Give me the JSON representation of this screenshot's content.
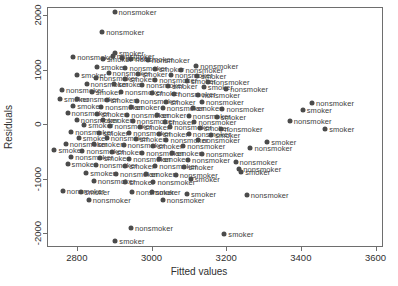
{
  "chart_data": {
    "type": "scatter",
    "title": "",
    "xlabel": "Fitted values",
    "ylabel": "Residuals",
    "xlim": [
      2720,
      3620
    ],
    "ylim": [
      -2250,
      2150
    ],
    "xticks": [
      2800,
      3000,
      3200,
      3400,
      3600
    ],
    "yticks": [
      2000,
      1000,
      0,
      -1000,
      -2000
    ],
    "xtick_labels": [
      "2800",
      "3000",
      "3200",
      "3400",
      "3600"
    ],
    "ytick_labels": [
      "2000",
      "1000",
      "0",
      "-1000",
      "-2000"
    ],
    "grid": false,
    "legend": "none",
    "point_color": "#4b4b4b",
    "label_color": "#414141",
    "axis_color": "#6e6e6e",
    "label_field": "smoker status",
    "categories": [
      "nonsmoker",
      "smoker"
    ],
    "points": [
      {
        "x": 2901,
        "y": 2060,
        "label": "nonsmoker"
      },
      {
        "x": 2868,
        "y": 1690,
        "label": "nonsmoker"
      },
      {
        "x": 2902,
        "y": 1310,
        "label": "smoker"
      },
      {
        "x": 2790,
        "y": 1240,
        "label": "nonsmoker"
      },
      {
        "x": 2896,
        "y": 1255,
        "label": "nonsmoker"
      },
      {
        "x": 2920,
        "y": 1215,
        "label": "smoker"
      },
      {
        "x": 2946,
        "y": 1205,
        "label": "nonsmoker"
      },
      {
        "x": 2870,
        "y": 1190,
        "label": "smoker"
      },
      {
        "x": 2990,
        "y": 1170,
        "label": "nonsmoker"
      },
      {
        "x": 3120,
        "y": 1065,
        "label": "nonsmoker"
      },
      {
        "x": 2854,
        "y": 1050,
        "label": "smoker"
      },
      {
        "x": 2930,
        "y": 1040,
        "label": "nonsmoker"
      },
      {
        "x": 3010,
        "y": 1020,
        "label": "smoker"
      },
      {
        "x": 3080,
        "y": 1000,
        "label": "nonsmoker"
      },
      {
        "x": 2801,
        "y": 905,
        "label": "smoker"
      },
      {
        "x": 2885,
        "y": 935,
        "label": "nonsmoker"
      },
      {
        "x": 2965,
        "y": 930,
        "label": "smoker"
      },
      {
        "x": 3052,
        "y": 905,
        "label": "nonsmoker"
      },
      {
        "x": 3122,
        "y": 880,
        "label": "smoker"
      },
      {
        "x": 2850,
        "y": 845,
        "label": "nonsmoker"
      },
      {
        "x": 2930,
        "y": 830,
        "label": "smoker"
      },
      {
        "x": 3010,
        "y": 810,
        "label": "nonsmoker"
      },
      {
        "x": 3095,
        "y": 790,
        "label": "smoker"
      },
      {
        "x": 3150,
        "y": 780,
        "label": "nonsmoker"
      },
      {
        "x": 2826,
        "y": 745,
        "label": "nonsmoker"
      },
      {
        "x": 2900,
        "y": 730,
        "label": "smoker"
      },
      {
        "x": 2975,
        "y": 715,
        "label": "nonsmoker"
      },
      {
        "x": 3045,
        "y": 700,
        "label": "smoker"
      },
      {
        "x": 3140,
        "y": 690,
        "label": "smoker"
      },
      {
        "x": 3200,
        "y": 640,
        "label": "nonsmoker"
      },
      {
        "x": 2760,
        "y": 620,
        "label": "nonsmoker"
      },
      {
        "x": 2840,
        "y": 600,
        "label": "smoker"
      },
      {
        "x": 2918,
        "y": 590,
        "label": "nonsmoker"
      },
      {
        "x": 3000,
        "y": 575,
        "label": "smoker"
      },
      {
        "x": 3060,
        "y": 560,
        "label": "nonsmoker"
      },
      {
        "x": 3125,
        "y": 545,
        "label": "nonsmoker"
      },
      {
        "x": 2755,
        "y": 470,
        "label": "smoker"
      },
      {
        "x": 2800,
        "y": 455,
        "label": "nonsmoker"
      },
      {
        "x": 2880,
        "y": 440,
        "label": "smoker"
      },
      {
        "x": 2960,
        "y": 430,
        "label": "nonsmoker"
      },
      {
        "x": 3040,
        "y": 415,
        "label": "smoker"
      },
      {
        "x": 3135,
        "y": 400,
        "label": "nonsmoker"
      },
      {
        "x": 3430,
        "y": 395,
        "label": "nonsmoker"
      },
      {
        "x": 2790,
        "y": 330,
        "label": "smoker"
      },
      {
        "x": 2865,
        "y": 320,
        "label": "nonsmoker"
      },
      {
        "x": 2945,
        "y": 310,
        "label": "smoker"
      },
      {
        "x": 3030,
        "y": 300,
        "label": "nonsmoker"
      },
      {
        "x": 3110,
        "y": 290,
        "label": "smoker"
      },
      {
        "x": 3190,
        "y": 275,
        "label": "nonsmoker"
      },
      {
        "x": 3405,
        "y": 265,
        "label": "smoker"
      },
      {
        "x": 2775,
        "y": 200,
        "label": "nonsmoker"
      },
      {
        "x": 2855,
        "y": 185,
        "label": "smoker"
      },
      {
        "x": 2935,
        "y": 175,
        "label": "nonsmoker"
      },
      {
        "x": 3015,
        "y": 165,
        "label": "smoker"
      },
      {
        "x": 3100,
        "y": 155,
        "label": "nonsmoker"
      },
      {
        "x": 3175,
        "y": 140,
        "label": "smoker"
      },
      {
        "x": 2800,
        "y": 85,
        "label": "nonsmoker"
      },
      {
        "x": 2870,
        "y": 70,
        "label": "smoker"
      },
      {
        "x": 2950,
        "y": 60,
        "label": "nonsmoker"
      },
      {
        "x": 3035,
        "y": 50,
        "label": "smoker"
      },
      {
        "x": 3115,
        "y": 40,
        "label": "nonsmoker"
      },
      {
        "x": 3370,
        "y": 60,
        "label": "nonsmoker"
      },
      {
        "x": 2820,
        "y": -20,
        "label": "smoker"
      },
      {
        "x": 2890,
        "y": -35,
        "label": "nonsmoker"
      },
      {
        "x": 2970,
        "y": -45,
        "label": "smoker"
      },
      {
        "x": 3050,
        "y": -55,
        "label": "nonsmoker"
      },
      {
        "x": 3130,
        "y": -70,
        "label": "smoker"
      },
      {
        "x": 3185,
        "y": -80,
        "label": "nonsmoker"
      },
      {
        "x": 3465,
        "y": -95,
        "label": "smoker"
      },
      {
        "x": 2785,
        "y": -140,
        "label": "nonsmoker"
      },
      {
        "x": 2860,
        "y": -155,
        "label": "smoker"
      },
      {
        "x": 2940,
        "y": -165,
        "label": "nonsmoker"
      },
      {
        "x": 3020,
        "y": -175,
        "label": "smoker"
      },
      {
        "x": 3100,
        "y": -185,
        "label": "nonsmoker"
      },
      {
        "x": 3160,
        "y": -195,
        "label": "smoker"
      },
      {
        "x": 2805,
        "y": -245,
        "label": "smoker"
      },
      {
        "x": 2880,
        "y": -255,
        "label": "nonsmoker"
      },
      {
        "x": 2958,
        "y": -265,
        "label": "smoker"
      },
      {
        "x": 3040,
        "y": -280,
        "label": "nonsmoker"
      },
      {
        "x": 3125,
        "y": -290,
        "label": "nonsmoker"
      },
      {
        "x": 3310,
        "y": -330,
        "label": "smoker"
      },
      {
        "x": 2770,
        "y": -355,
        "label": "nonsmoker"
      },
      {
        "x": 2845,
        "y": -370,
        "label": "smoker"
      },
      {
        "x": 2925,
        "y": -380,
        "label": "nonsmoker"
      },
      {
        "x": 3005,
        "y": -395,
        "label": "smoker"
      },
      {
        "x": 3085,
        "y": -405,
        "label": "nonsmoker"
      },
      {
        "x": 3265,
        "y": -435,
        "label": "nonsmoker"
      },
      {
        "x": 2740,
        "y": -480,
        "label": "smoker"
      },
      {
        "x": 2815,
        "y": -495,
        "label": "nonsmoker"
      },
      {
        "x": 2895,
        "y": -505,
        "label": "smoker"
      },
      {
        "x": 2975,
        "y": -520,
        "label": "nonsmoker"
      },
      {
        "x": 3055,
        "y": -530,
        "label": "smoker"
      },
      {
        "x": 3135,
        "y": -545,
        "label": "nonsmoker"
      },
      {
        "x": 2785,
        "y": -605,
        "label": "nonsmoker"
      },
      {
        "x": 2862,
        "y": -620,
        "label": "smoker"
      },
      {
        "x": 2940,
        "y": -635,
        "label": "nonsmoker"
      },
      {
        "x": 3020,
        "y": -645,
        "label": "smoker"
      },
      {
        "x": 3098,
        "y": -660,
        "label": "nonsmoker"
      },
      {
        "x": 3225,
        "y": -690,
        "label": "nonsmoker"
      },
      {
        "x": 2775,
        "y": -730,
        "label": "smoker"
      },
      {
        "x": 2850,
        "y": -745,
        "label": "nonsmoker"
      },
      {
        "x": 2930,
        "y": -760,
        "label": "smoker"
      },
      {
        "x": 3010,
        "y": -770,
        "label": "nonsmoker"
      },
      {
        "x": 3088,
        "y": -785,
        "label": "smoker"
      },
      {
        "x": 3235,
        "y": -825,
        "label": "nonsmoker"
      },
      {
        "x": 3240,
        "y": -870,
        "label": "smoker"
      },
      {
        "x": 2825,
        "y": -890,
        "label": "smoker"
      },
      {
        "x": 2905,
        "y": -905,
        "label": "nonsmoker"
      },
      {
        "x": 2985,
        "y": -915,
        "label": "smoker"
      },
      {
        "x": 3065,
        "y": -930,
        "label": "nonsmoker"
      },
      {
        "x": 3105,
        "y": -1010,
        "label": "smoker"
      },
      {
        "x": 2845,
        "y": -1035,
        "label": "nonsmoker"
      },
      {
        "x": 2930,
        "y": -1050,
        "label": "smoker"
      },
      {
        "x": 3005,
        "y": -1060,
        "label": "nonsmoker"
      },
      {
        "x": 2762,
        "y": -1230,
        "label": "nonsmoker"
      },
      {
        "x": 2810,
        "y": -1240,
        "label": "smoker"
      },
      {
        "x": 2948,
        "y": -1235,
        "label": "nonsmoker"
      },
      {
        "x": 3000,
        "y": -1245,
        "label": "smoker"
      },
      {
        "x": 3095,
        "y": -1280,
        "label": "smoker"
      },
      {
        "x": 3255,
        "y": -1290,
        "label": "nonsmoker"
      },
      {
        "x": 2832,
        "y": -1395,
        "label": "nonsmoker"
      },
      {
        "x": 3030,
        "y": -1385,
        "label": "nonsmoker"
      },
      {
        "x": 2945,
        "y": -1905,
        "label": "nonsmoker"
      },
      {
        "x": 3195,
        "y": -2010,
        "label": "smoker"
      },
      {
        "x": 2903,
        "y": -2135,
        "label": "smoker"
      }
    ]
  }
}
